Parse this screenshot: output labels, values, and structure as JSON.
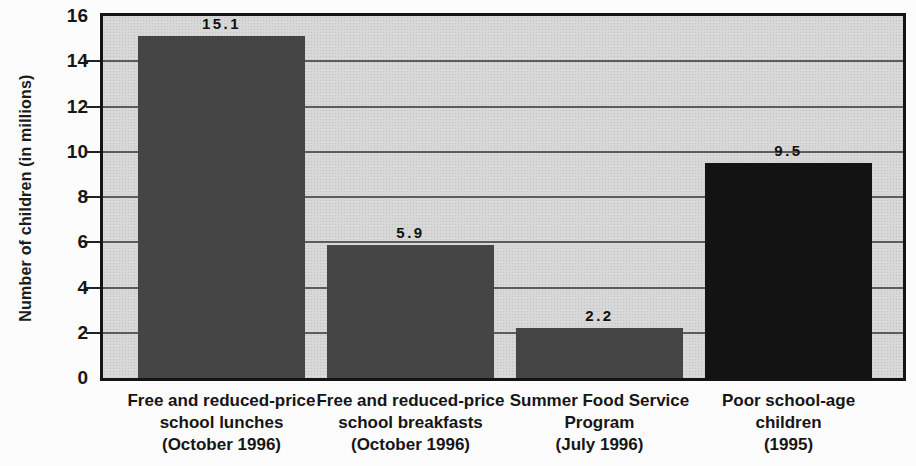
{
  "chart_data": {
    "type": "bar",
    "title": "",
    "xlabel": "",
    "ylabel": "Number of children (in millions)",
    "ylim": [
      0,
      16
    ],
    "ytick_step": 2,
    "ytick_labels": [
      "0",
      "2",
      "4",
      "6",
      "8",
      "10",
      "12",
      "14",
      "16"
    ],
    "grid": true,
    "legend_position": "none",
    "categories": [
      [
        "Free and reduced-price",
        "school lunches",
        "(October 1996)"
      ],
      [
        "Free and reduced-price",
        "school breakfasts",
        "(October 1996)"
      ],
      [
        "Summer Food Service",
        "Program",
        "(July 1996)"
      ],
      [
        "Poor school-age",
        "children",
        "(1995)"
      ]
    ],
    "values": [
      15.1,
      5.9,
      2.2,
      9.5
    ],
    "value_labels": [
      "15.1",
      "5.9",
      "2.2",
      "9.5"
    ],
    "bar_colors": [
      "#454545",
      "#454545",
      "#454545",
      "#131313"
    ],
    "plot_background_color": "#d8d8d8",
    "gridline_color": "#5c5c5c",
    "axis_border_color": "#141414"
  }
}
